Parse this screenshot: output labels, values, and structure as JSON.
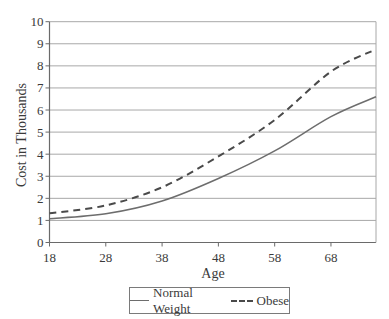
{
  "chart_data": {
    "type": "line",
    "title": "",
    "xlabel": "Age",
    "ylabel": "Cost in Thousands",
    "xlim": [
      18,
      76
    ],
    "ylim": [
      0,
      10
    ],
    "x_ticks": [
      18,
      28,
      38,
      48,
      58,
      68
    ],
    "y_ticks": [
      0,
      1,
      2,
      3,
      4,
      5,
      6,
      7,
      8,
      9,
      10
    ],
    "grid": "horizontal",
    "legend_position": "bottom",
    "x": [
      18,
      28,
      38,
      48,
      58,
      68,
      76
    ],
    "series": [
      {
        "name": "Normal Weight",
        "style": "solid",
        "color": "#6d6d6d",
        "values": [
          1.08,
          1.3,
          1.88,
          2.9,
          4.15,
          5.7,
          6.6
        ]
      },
      {
        "name": "Obese",
        "style": "dashed",
        "color": "#4a4a4a",
        "values": [
          1.32,
          1.68,
          2.5,
          3.9,
          5.55,
          7.74,
          8.75
        ]
      }
    ]
  },
  "legend": {
    "items": [
      {
        "label": "Normal Weight",
        "style": "solid"
      },
      {
        "label": "Obese",
        "style": "dashed"
      }
    ]
  }
}
